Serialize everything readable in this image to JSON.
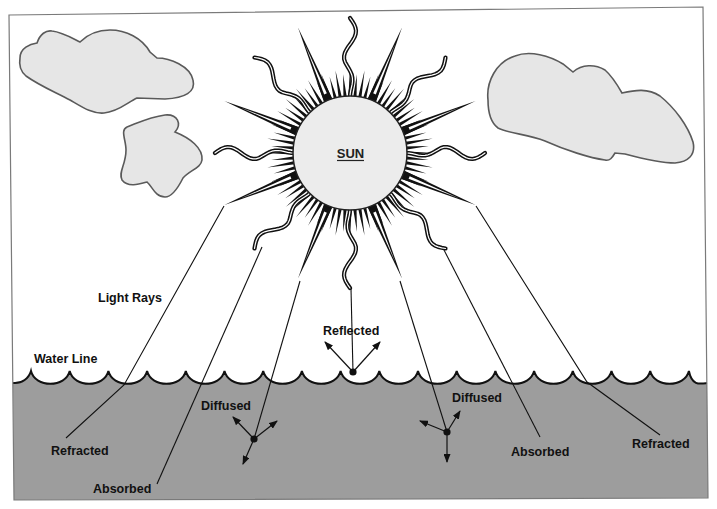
{
  "diagram": {
    "sun_label": "SUN",
    "labels": {
      "light_rays": "Light Rays",
      "water_line": "Water Line",
      "reflected": "Reflected",
      "diffused_left": "Diffused",
      "diffused_right": "Diffused",
      "refracted_left": "Refracted",
      "refracted_right": "Refracted",
      "absorbed_left": "Absorbed",
      "absorbed_right": "Absorbed"
    },
    "colors": {
      "background": "#ffffff",
      "water": "#9d9d9d",
      "cloud_fill": "#e6e6e6",
      "sun_fill": "#ececec",
      "ink": "#111111",
      "frame": "#7a7a7a"
    }
  }
}
